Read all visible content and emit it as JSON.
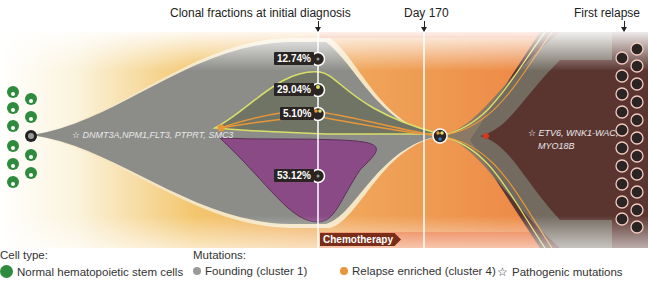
{
  "timepoints": [
    {
      "label": "Clonal fractions at initial diagnosis",
      "x": 318
    },
    {
      "label": "Day 170",
      "x": 424
    },
    {
      "label": "First relapse",
      "x": 624
    }
  ],
  "clones_at_diagnosis": [
    {
      "percent": "12.74%",
      "y": 59
    },
    {
      "percent": "29.04%",
      "y": 90
    },
    {
      "percent": "5.10%",
      "y": 114
    },
    {
      "percent": "53.12%",
      "y": 176
    }
  ],
  "founding_mutations": "DNMT3A,NPM1,FLT3, PTPRT, SMC3",
  "relapse_mutations": [
    "ETV6, WNK1-WAC,",
    "MYO18B"
  ],
  "treatment": {
    "label": "Chemotherapy"
  },
  "legend": {
    "cell_type_title": "Cell type:",
    "cell_type_item": "Normal hematopoietic stem cells",
    "mutations_title": "Mutations:",
    "founding": "Founding (cluster 1)",
    "relapse_enriched": "Relapse enriched (cluster 4)",
    "pathogenic": "Pathogenic mutations"
  },
  "colors": {
    "normal_cell": "#2e8b3e",
    "founding": "#8a8a8a",
    "subclone_purple": "#8a4a86",
    "relapse_enriched": "#e8963a",
    "relapse_bg": "#5a3530",
    "chemo_band": "#e8642a"
  }
}
